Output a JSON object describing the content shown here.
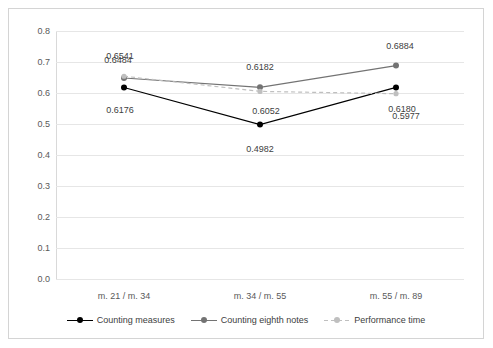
{
  "chart_data": {
    "type": "line",
    "title": "",
    "xlabel": "",
    "ylabel": "",
    "categories": [
      "m. 21 / m. 34",
      "m. 34 / m. 55",
      "m. 55 / m. 89"
    ],
    "ylim": [
      0.0,
      0.8
    ],
    "yticks": [
      "0.0",
      "0.1",
      "0.2",
      "0.3",
      "0.4",
      "0.5",
      "0.6",
      "0.7",
      "0.8"
    ],
    "grid": true,
    "legend_position": "bottom",
    "series": [
      {
        "name": "Counting measures",
        "color": "#000000",
        "style": "solid",
        "values": [
          0.6176,
          0.4982,
          0.618
        ],
        "labels": [
          "0.6176",
          "0.4982",
          "0.6180"
        ]
      },
      {
        "name": "Counting eighth notes",
        "color": "#737373",
        "style": "solid",
        "values": [
          0.6484,
          0.6182,
          0.6884
        ],
        "labels": [
          "0.6484",
          "0.6182",
          "0.6884"
        ]
      },
      {
        "name": "Performance time",
        "color": "#bfbfbf",
        "style": "dashed",
        "values": [
          0.6541,
          0.6052,
          0.5977
        ],
        "labels": [
          "0.6541",
          "0.6052",
          "0.5977"
        ]
      }
    ]
  },
  "legend": {
    "items": [
      {
        "label": "Counting measures"
      },
      {
        "label": "Counting eighth notes"
      },
      {
        "label": "Performance time"
      }
    ]
  }
}
